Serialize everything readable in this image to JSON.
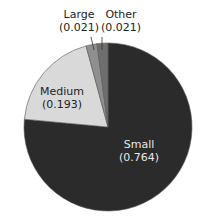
{
  "chart_data": {
    "type": "pie",
    "title": "",
    "categories": [
      "Small",
      "Medium",
      "Large",
      "Other"
    ],
    "values": [
      0.764,
      0.193,
      0.021,
      0.021
    ],
    "colors": [
      "#2b2b2b",
      "#d9d9d9",
      "#8f8f8f",
      "#6e6e6e"
    ],
    "labels": [
      {
        "name": "Small",
        "value": "(0.764)"
      },
      {
        "name": "Medium",
        "value": "(0.193)"
      },
      {
        "name": "Large",
        "value": "(0.021)"
      },
      {
        "name": "Other",
        "value": "(0.021)"
      }
    ],
    "legend": "none"
  }
}
